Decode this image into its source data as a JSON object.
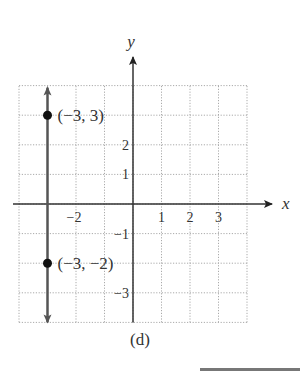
{
  "chart_data": {
    "type": "line",
    "title": "",
    "caption": "(d)",
    "xlabel": "x",
    "ylabel": "y",
    "xlim": [
      -4,
      4
    ],
    "ylim": [
      -4,
      4
    ],
    "grid": true,
    "grid_style": "dotted",
    "x_tick_labels": [
      {
        "value": -2,
        "label": "−2"
      },
      {
        "value": 1,
        "label": "1"
      },
      {
        "value": 2,
        "label": "2"
      },
      {
        "value": 3,
        "label": "3"
      }
    ],
    "y_tick_labels": [
      {
        "value": 2,
        "label": "2"
      },
      {
        "value": 1,
        "label": "1"
      },
      {
        "value": -1,
        "label": "−1"
      },
      {
        "value": -3,
        "label": "−3"
      }
    ],
    "series": [
      {
        "name": "vertical line x = -3",
        "kind": "line-with-arrows",
        "x": [
          -3,
          -3
        ],
        "y": [
          -4,
          4
        ]
      }
    ],
    "points": [
      {
        "x": -3,
        "y": 3,
        "label": "(−3, 3)"
      },
      {
        "x": -3,
        "y": -2,
        "label": "(−3, −2)"
      }
    ]
  },
  "labels": {
    "x_axis": "x",
    "y_axis": "y",
    "caption": "(d)"
  }
}
